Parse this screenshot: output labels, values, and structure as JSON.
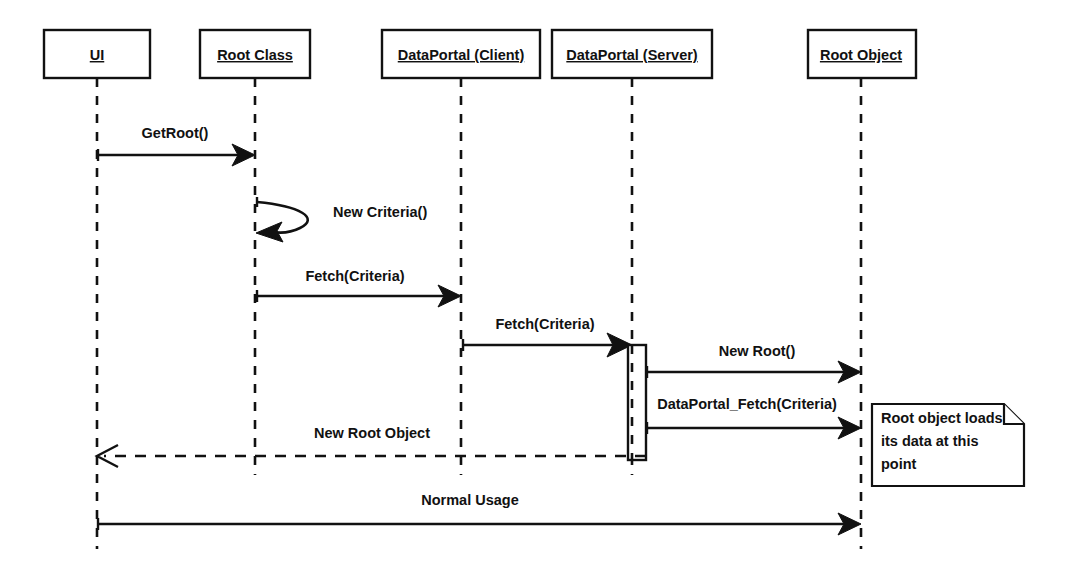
{
  "diagram": {
    "type": "uml-sequence-diagram",
    "background_color": "#ffffff",
    "line_color": "#111111",
    "width": 1072,
    "height": 569,
    "participants": [
      {
        "id": "ui",
        "label": "UI",
        "box_x": 44,
        "box_y": 30,
        "box_w": 106,
        "box_h": 48,
        "lifeline_x": 97,
        "lifeline_top": 78,
        "lifeline_bottom": 549
      },
      {
        "id": "root-class",
        "label": "Root Class",
        "box_x": 200,
        "box_y": 30,
        "box_w": 110,
        "box_h": 48,
        "lifeline_x": 255,
        "lifeline_top": 78,
        "lifeline_bottom": 475
      },
      {
        "id": "dataportal-client",
        "label": "DataPortal (Client)",
        "box_x": 382,
        "box_y": 30,
        "box_w": 158,
        "box_h": 48,
        "lifeline_x": 461,
        "lifeline_top": 78,
        "lifeline_bottom": 475
      },
      {
        "id": "dataportal-server",
        "label": "DataPortal (Server)",
        "box_x": 552,
        "box_y": 30,
        "box_w": 160,
        "box_h": 48,
        "lifeline_x": 632,
        "lifeline_top": 78,
        "lifeline_bottom": 475
      },
      {
        "id": "root-object",
        "label": "Root Object",
        "box_x": 808,
        "box_y": 30,
        "box_w": 108,
        "box_h": 48,
        "lifeline_x": 861,
        "lifeline_top": 78,
        "lifeline_bottom": 549
      }
    ],
    "messages": [
      {
        "id": "msg-getroot",
        "label": "GetRoot()",
        "from": "ui",
        "to": "root-class",
        "x1": 97,
        "x2": 255,
        "y": 155,
        "style": "solid",
        "arrow": "filled",
        "label_x": 175,
        "label_y": 138,
        "direction": "right"
      },
      {
        "id": "msg-new-criteria",
        "label": "New Criteria()",
        "from": "root-class",
        "to": "root-class",
        "y": 205,
        "y2": 232,
        "style": "solid",
        "arrow": "filled",
        "label_x": 333,
        "label_y": 217,
        "direction": "self"
      },
      {
        "id": "msg-fetch-criteria-1",
        "label": "Fetch(Criteria)",
        "from": "root-class",
        "to": "dataportal-client",
        "x1": 255,
        "x2": 461,
        "y": 296,
        "style": "solid",
        "arrow": "filled",
        "label_x": 355,
        "label_y": 281,
        "direction": "right"
      },
      {
        "id": "msg-fetch-criteria-2",
        "label": "Fetch(Criteria)",
        "from": "dataportal-client",
        "to": "dataportal-server",
        "x1": 461,
        "x2": 632,
        "y": 345,
        "style": "solid",
        "arrow": "filled",
        "label_x": 545,
        "label_y": 329,
        "direction": "right"
      },
      {
        "id": "msg-new-root",
        "label": "New Root()",
        "from": "dataportal-server",
        "to": "root-object",
        "x1": 645,
        "x2": 861,
        "y": 372,
        "style": "solid",
        "arrow": "filled",
        "label_x": 757,
        "label_y": 356,
        "direction": "right"
      },
      {
        "id": "msg-dataportal-fetch",
        "label": "DataPortal_Fetch(Criteria)",
        "from": "dataportal-server",
        "to": "root-object",
        "x1": 645,
        "x2": 861,
        "y": 428,
        "style": "solid",
        "arrow": "filled",
        "label_x": 747,
        "label_y": 409,
        "direction": "right"
      },
      {
        "id": "msg-new-root-object",
        "label": "New Root Object",
        "from": "dataportal-server",
        "to": "ui",
        "x1": 645,
        "x2": 97,
        "y": 456,
        "style": "dashed",
        "arrow": "open",
        "label_x": 372,
        "label_y": 438,
        "direction": "left"
      },
      {
        "id": "msg-normal-usage",
        "label": "Normal Usage",
        "from": "ui",
        "to": "root-object",
        "x1": 97,
        "x2": 861,
        "y": 524,
        "style": "solid",
        "arrow": "filled",
        "label_x": 470,
        "label_y": 505,
        "direction": "right"
      }
    ],
    "activations": [
      {
        "id": "activation-dataportal-server",
        "on": "dataportal-server",
        "x": 628,
        "y": 345,
        "w": 18,
        "h": 115
      }
    ],
    "notes": [
      {
        "id": "note-root-object-loads",
        "lines": [
          "Root object loads",
          "its data at this",
          "point"
        ],
        "x": 872,
        "y": 404,
        "w": 152,
        "h": 82,
        "fold": 20,
        "text_x": 881,
        "first_line_y": 422,
        "line_height": 23
      }
    ]
  }
}
